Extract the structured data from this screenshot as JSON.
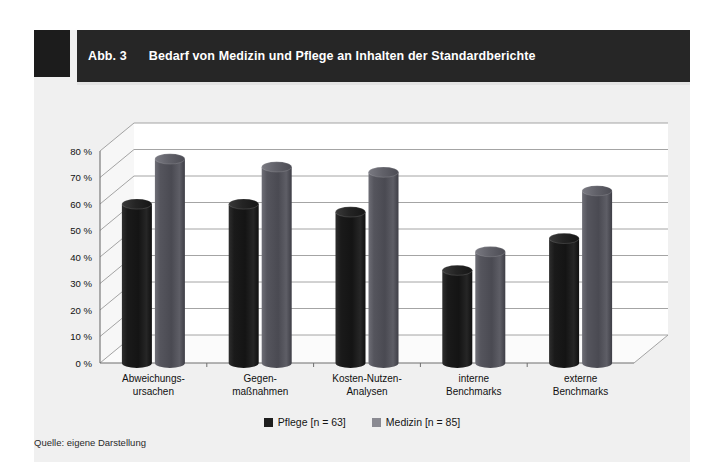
{
  "figure": {
    "number_label": "Abb. 3",
    "title": "Bedarf von Medizin und Pflege an Inhalten der Standardberichte",
    "source_note": "Quelle: eigene Darstellung"
  },
  "legend": {
    "entries": [
      {
        "label": "Pflege [n = 63]",
        "color": "#1e1e1e",
        "icon": "square-swatch"
      },
      {
        "label": "Medizin [n = 85]",
        "color": "#707078",
        "icon": "square-swatch"
      }
    ]
  },
  "chart_data": {
    "type": "bar",
    "title": "Bedarf von Medizin und Pflege an Inhalten der Standardberichte",
    "xlabel": "",
    "ylabel": "",
    "ylim": [
      0,
      80
    ],
    "grid": true,
    "legend_position": "bottom",
    "tick_labels": [
      "0 %",
      "10 %",
      "20 %",
      "30 %",
      "40 %",
      "50 %",
      "60 %",
      "70 %",
      "80 %"
    ],
    "tick_values": [
      0,
      10,
      20,
      30,
      40,
      50,
      60,
      70,
      80
    ],
    "categories": [
      "Abweichungs-\nursachen",
      "Gegen-\nmaßnahmen",
      "Kosten-Nutzen-\nAnalysen",
      "interne\nBenchmarks",
      "externe\nBenchmarks"
    ],
    "categories_lines": [
      [
        "Abweichungs-",
        "ursachen"
      ],
      [
        "Gegen-",
        "maßnahmen"
      ],
      [
        "Kosten-Nutzen-",
        "Analysen"
      ],
      [
        "interne",
        "Benchmarks"
      ],
      [
        "externe",
        "Benchmarks"
      ]
    ],
    "series": [
      {
        "name": "Pflege [n = 63]",
        "color": "#1e1e1e",
        "values": [
          60,
          60,
          57,
          35,
          47
        ]
      },
      {
        "name": "Medizin [n = 85]",
        "color": "#707078",
        "values": [
          77,
          74,
          72,
          42,
          65
        ]
      }
    ]
  }
}
